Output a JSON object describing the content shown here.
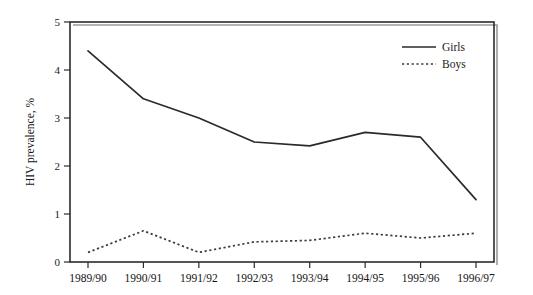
{
  "chart_data": {
    "type": "line",
    "title": "",
    "xlabel": "",
    "ylabel": "HIV prevalence, %",
    "categories": [
      "1989/90",
      "1990/91",
      "1991/92",
      "1992/93",
      "1993/94",
      "1994/95",
      "1995/96",
      "1996/97"
    ],
    "ylim": [
      0,
      5
    ],
    "yticks": [
      "0",
      "1",
      "2",
      "3",
      "4",
      "5"
    ],
    "ytick_values": [
      0,
      1,
      2,
      3,
      4,
      5
    ],
    "grid": false,
    "legend_position": "top-right",
    "series": [
      {
        "name": "Girls",
        "style": "solid",
        "color": "#2a2a2a",
        "values": [
          4.4,
          3.4,
          3.0,
          2.5,
          2.42,
          2.7,
          2.6,
          1.3
        ]
      },
      {
        "name": "Boys",
        "style": "dotted",
        "color": "#3a3a3a",
        "values": [
          0.2,
          0.65,
          0.2,
          0.42,
          0.45,
          0.6,
          0.5,
          0.6
        ]
      }
    ]
  },
  "legend": {
    "items": [
      {
        "label": "Girls",
        "style": "solid"
      },
      {
        "label": "Boys",
        "style": "dotted"
      }
    ]
  }
}
